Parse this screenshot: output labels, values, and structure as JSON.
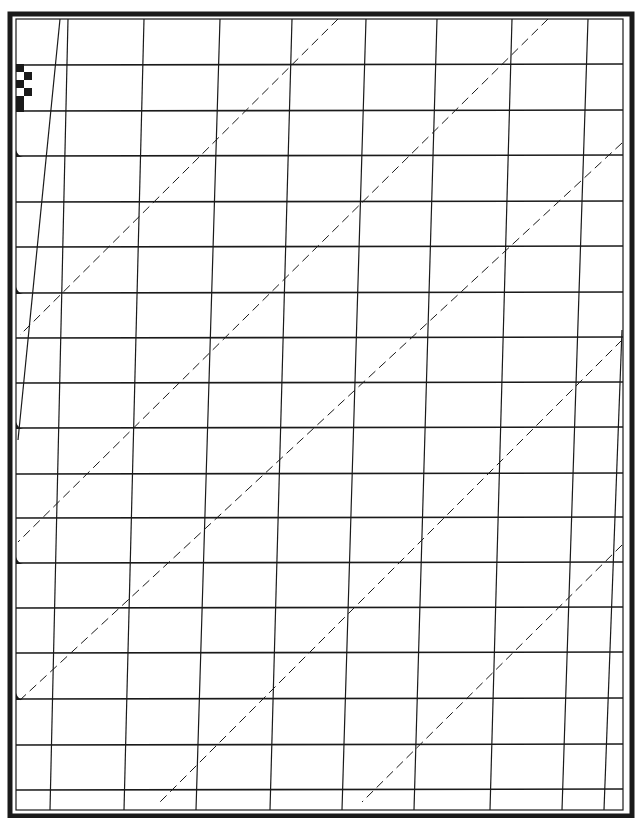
{
  "sheet": {
    "width": 640,
    "height": 818,
    "background": "#ffffff",
    "ink": "#1a1a1a",
    "outer_frame": {
      "x": 10,
      "y": 14,
      "w": 622,
      "h": 802,
      "stroke": 5
    },
    "inner_frame": {
      "x": 16,
      "y": 19,
      "w": 607,
      "h": 791,
      "stroke": 1.2
    },
    "ruled_lines_y": [
      65,
      111,
      156,
      202,
      247,
      293,
      338,
      383,
      428,
      474,
      518,
      563,
      608,
      653,
      699,
      745,
      790
    ],
    "ruled_x_start": 16,
    "ruled_x_end": 623,
    "slant_lines": [
      {
        "x1": 60,
        "y1": 19,
        "x2": 18,
        "y2": 440
      },
      {
        "x1": 68,
        "y1": 19,
        "x2": 50,
        "y2": 810
      },
      {
        "x1": 144,
        "y1": 19,
        "x2": 124,
        "y2": 810
      },
      {
        "x1": 220,
        "y1": 19,
        "x2": 196,
        "y2": 810
      },
      {
        "x1": 292,
        "y1": 19,
        "x2": 270,
        "y2": 810
      },
      {
        "x1": 366,
        "y1": 19,
        "x2": 342,
        "y2": 810
      },
      {
        "x1": 437,
        "y1": 19,
        "x2": 414,
        "y2": 810
      },
      {
        "x1": 512,
        "y1": 19,
        "x2": 490,
        "y2": 810
      },
      {
        "x1": 588,
        "y1": 19,
        "x2": 562,
        "y2": 810
      },
      {
        "x1": 622,
        "y1": 330,
        "x2": 604,
        "y2": 810
      }
    ],
    "dashed_lines": [
      {
        "x1": 338,
        "y1": 19,
        "x2": 20,
        "y2": 335
      },
      {
        "x1": 548,
        "y1": 19,
        "x2": 18,
        "y2": 542
      },
      {
        "x1": 622,
        "y1": 143,
        "x2": 20,
        "y2": 700
      },
      {
        "x1": 622,
        "y1": 340,
        "x2": 160,
        "y2": 802
      },
      {
        "x1": 622,
        "y1": 545,
        "x2": 362,
        "y2": 802
      }
    ],
    "dash_pattern": "9 5",
    "checker_marker": {
      "x": 16,
      "y": 65,
      "cell": 8,
      "cells": [
        [
          0,
          0
        ],
        [
          1,
          1
        ],
        [
          0,
          2
        ],
        [
          1,
          3
        ],
        [
          0,
          4
        ],
        [
          0,
          5
        ]
      ]
    },
    "tick_markers_y": [
      156,
      293,
      428,
      563,
      699
    ]
  }
}
